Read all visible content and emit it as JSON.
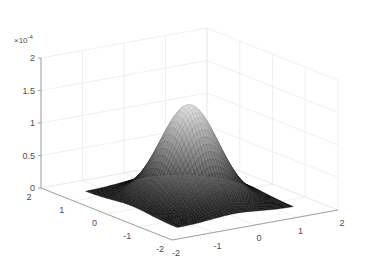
{
  "chart_data": {
    "type": "surface",
    "title": "",
    "xlabel": "",
    "ylabel": "",
    "zlabel": "",
    "z_exponent_label": "× 10^-4",
    "x_ticks": [
      -2,
      -1,
      0,
      1,
      2
    ],
    "y_ticks": [
      -2,
      -1,
      0,
      1,
      2
    ],
    "z_ticks": [
      0,
      0.5,
      1,
      1.5,
      2
    ],
    "z_tick_labels": [
      "0",
      "0.5",
      "1",
      "1.5",
      "2"
    ],
    "xlim": [
      -2,
      2
    ],
    "ylim": [
      -2,
      2
    ],
    "zlim": [
      0,
      2
    ],
    "z_scale": 0.0001,
    "grid": true,
    "surface": {
      "shape": "gaussian bump",
      "peak_x": 0,
      "peak_y": 0,
      "peak_z": 1.45,
      "colormap": "gray",
      "x_domain": [
        -1.4,
        1.4
      ],
      "y_domain": [
        -1.4,
        1.4
      ]
    }
  },
  "axes": {
    "z_multiplier_text": "×10",
    "z_multiplier_exp": "-4",
    "x_tick_labels": [
      "-2",
      "-1",
      "0",
      "1",
      "2"
    ],
    "y_tick_labels": [
      "-2",
      "-1",
      "0",
      "1",
      "2"
    ],
    "z_tick_labels": [
      "0",
      "0.5",
      "1",
      "1.5",
      "2"
    ]
  }
}
